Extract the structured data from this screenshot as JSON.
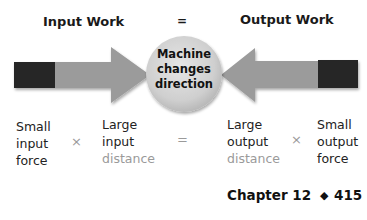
{
  "header": {
    "left_title": "Input Work",
    "equals": "=",
    "right_title": "Output Work"
  },
  "diagram": {
    "center_label": [
      "Machine",
      "changes",
      "direction"
    ],
    "arrow_color": "#9b9b9b",
    "block_color": "#262626",
    "circle_color": "#d4d4d4"
  },
  "equation": {
    "terms": [
      {
        "lines": [
          "Small",
          "input",
          "force"
        ],
        "muted_line": null
      },
      {
        "lines": [
          "Large",
          "input",
          "distance"
        ],
        "muted_line": 2
      },
      {
        "lines": [
          "Large",
          "output",
          "distance"
        ],
        "muted_line": 2
      },
      {
        "lines": [
          "Small",
          "output",
          "force"
        ],
        "muted_line": null
      }
    ],
    "operators": [
      "×",
      "=",
      "×"
    ]
  },
  "footer": {
    "chapter": "Chapter 12",
    "bullet": "◆",
    "page": "415"
  }
}
